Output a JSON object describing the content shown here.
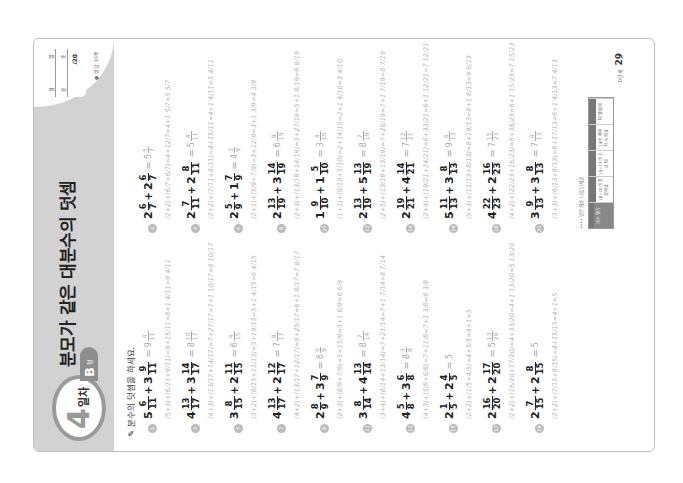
{
  "header": {
    "day_number": "4",
    "day_label": "일차",
    "type_letter": "B",
    "type_suffix": "형",
    "title": "분모가 같은 대분수의 덧셈",
    "score_labels": [
      "월",
      "일",
      "분",
      "초"
    ],
    "score_total": "/20",
    "answer_note": "● 정답 10쪽"
  },
  "instruction": "분수의 덧셈을 하세요.",
  "problems_left": [
    {
      "no": "1",
      "a": {
        "w": "5",
        "n": "6",
        "d": "11"
      },
      "b": {
        "w": "3",
        "n": "9",
        "d": "11"
      },
      "ans": {
        "w": "9",
        "n": "4",
        "d": "11"
      },
      "work": "(5+3)+(6/11+9/11)=8+15/11=8+1 4/11=9 4/11"
    },
    {
      "no": "3",
      "a": {
        "w": "4",
        "n": "13",
        "d": "17"
      },
      "b": {
        "w": "3",
        "n": "14",
        "d": "17"
      },
      "ans": {
        "w": "8",
        "n": "10",
        "d": "17"
      },
      "work": "(4+3)+(13/17+14/17)=7+27/17=7+1 10/17=8 10/17"
    },
    {
      "no": "5",
      "a": {
        "w": "3",
        "n": "8",
        "d": "15"
      },
      "b": {
        "w": "2",
        "n": "11",
        "d": "15"
      },
      "ans": {
        "w": "6",
        "n": "4",
        "d": "15"
      },
      "work": "(3+2)+(8/15+11/15)=5+19/15=5+1 4/15=6 4/15"
    },
    {
      "no": "7",
      "a": {
        "w": "4",
        "n": "13",
        "d": "17"
      },
      "b": {
        "w": "2",
        "n": "12",
        "d": "17"
      },
      "ans": {
        "w": "7",
        "n": "8",
        "d": "17"
      },
      "work": "(4+2)+(13/17+12/17)=6+25/17=6+1 8/17=7 8/17"
    },
    {
      "no": "9",
      "a": {
        "w": "2",
        "n": "8",
        "d": "9"
      },
      "b": {
        "w": "3",
        "n": "7",
        "d": "9"
      },
      "ans": {
        "w": "6",
        "n": "6",
        "d": "9"
      },
      "work": "(2+3)+(8/9+7/9)=5+15/9=5+1 6/9=6 6/9"
    },
    {
      "no": "11",
      "a": {
        "w": "3",
        "n": "8",
        "d": "14"
      },
      "b": {
        "w": "4",
        "n": "13",
        "d": "14"
      },
      "ans": {
        "w": "8",
        "n": "7",
        "d": "14"
      },
      "work": "(3+4)+(8/14+13/14)=7+21/14=7+1 7/14=8 7/14"
    },
    {
      "no": "13",
      "a": {
        "w": "4",
        "n": "5",
        "d": "8"
      },
      "b": {
        "w": "3",
        "n": "6",
        "d": "8"
      },
      "ans": {
        "w": "8",
        "n": "3",
        "d": "8"
      },
      "work": "(4+3)+(5/8+6/8)=7+11/8=7+1 3/8=8 3/8"
    },
    {
      "no": "15",
      "a": {
        "w": "2",
        "n": "1",
        "d": "5"
      },
      "b": {
        "w": "2",
        "n": "4",
        "d": "5"
      },
      "ans": {
        "w": "5",
        "n": "",
        "d": ""
      },
      "work": "(2+2)+(1/5+4/5)=4+5/5=4+1=5"
    },
    {
      "no": "17",
      "a": {
        "w": "2",
        "n": "16",
        "d": "20"
      },
      "b": {
        "w": "2",
        "n": "17",
        "d": "20"
      },
      "ans": {
        "w": "5",
        "n": "13",
        "d": "20"
      },
      "work": "(2+2)+(16/20+17/20)=4+33/20=4+1 13/20=5 13/20"
    },
    {
      "no": "19",
      "a": {
        "w": "2",
        "n": "7",
        "d": "15"
      },
      "b": {
        "w": "2",
        "n": "8",
        "d": "15"
      },
      "ans": {
        "w": "5",
        "n": "",
        "d": ""
      },
      "work": "(2+2)+(7/15+8/15)=4+15/15=4+1=5"
    }
  ],
  "problems_right": [
    {
      "no": "2",
      "a": {
        "w": "2",
        "n": "6",
        "d": "7"
      },
      "b": {
        "w": "2",
        "n": "6",
        "d": "7"
      },
      "ans": {
        "w": "5",
        "n": "5",
        "d": "7"
      },
      "work": "(2+2)+(6/7+6/7)=4+12/7=4+1 5/7=5 5/7"
    },
    {
      "no": "4",
      "a": {
        "w": "2",
        "n": "7",
        "d": "11"
      },
      "b": {
        "w": "2",
        "n": "8",
        "d": "11"
      },
      "ans": {
        "w": "5",
        "n": "4",
        "d": "11"
      },
      "work": "(2+2)+(7/11+8/11)=4+15/11=4+1 4/11=5 4/11"
    },
    {
      "no": "6",
      "a": {
        "w": "2",
        "n": "5",
        "d": "9"
      },
      "b": {
        "w": "1",
        "n": "7",
        "d": "9"
      },
      "ans": {
        "w": "4",
        "n": "3",
        "d": "9"
      },
      "work": "(2+1)+(5/9+7/9)=3+12/9=3+1 3/9=4 3/9"
    },
    {
      "no": "8",
      "a": {
        "w": "2",
        "n": "13",
        "d": "19"
      },
      "b": {
        "w": "3",
        "n": "14",
        "d": "19"
      },
      "ans": {
        "w": "6",
        "n": "8",
        "d": "19"
      },
      "work": "(2+3)+(13/19+14/19)=5+27/19=5+1 8/19=6 8/19"
    },
    {
      "no": "10",
      "a": {
        "w": "1",
        "n": "9",
        "d": "10"
      },
      "b": {
        "w": "1",
        "n": "5",
        "d": "10"
      },
      "ans": {
        "w": "3",
        "n": "4",
        "d": "10"
      },
      "work": "(1+1)+(9/10+5/10)=2+14/10=2+1 4/10=3 4/10"
    },
    {
      "no": "12",
      "a": {
        "w": "2",
        "n": "13",
        "d": "19"
      },
      "b": {
        "w": "5",
        "n": "13",
        "d": "19"
      },
      "ans": {
        "w": "8",
        "n": "7",
        "d": "19"
      },
      "work": "(2+5)+(13/19+13/19)=7+26/19=7+1 7/19=8 7/19"
    },
    {
      "no": "14",
      "a": {
        "w": "2",
        "n": "19",
        "d": "21"
      },
      "b": {
        "w": "4",
        "n": "14",
        "d": "21"
      },
      "ans": {
        "w": "7",
        "n": "12",
        "d": "21"
      },
      "work": "(2+4)+(19/21+14/21)=6+33/21=6+1 12/21=7 12/21"
    },
    {
      "no": "16",
      "a": {
        "w": "5",
        "n": "11",
        "d": "13"
      },
      "b": {
        "w": "3",
        "n": "8",
        "d": "13"
      },
      "ans": {
        "w": "9",
        "n": "6",
        "d": "13"
      },
      "work": "(5+3)+(11/13+8/13)=8+19/13=8+1 6/13=9 6/13"
    },
    {
      "no": "18",
      "a": {
        "w": "4",
        "n": "22",
        "d": "23"
      },
      "b": {
        "w": "2",
        "n": "16",
        "d": "23"
      },
      "ans": {
        "w": "7",
        "n": "15",
        "d": "23"
      },
      "work": "(4+2)+(22/23+16/23)=6+38/23=6+1 15/23=7 15/23"
    },
    {
      "no": "20",
      "a": {
        "w": "3",
        "n": "9",
        "d": "13"
      },
      "b": {
        "w": "3",
        "n": "8",
        "d": "13"
      },
      "ans": {
        "w": "7",
        "n": "4",
        "d": "13"
      },
      "work": "(3+3)+(9/13+8/13)=6+17/13=6+1 4/13=7 4/13"
    }
  ],
  "footer": {
    "note": "•••• 맞은 개수 다음 단계로",
    "table_cells": [
      "개수 평가",
      "18~20개 잘했어요",
      "15~17개 조금 더",
      "14개 이하 다시 해요",
      "더 열심히"
    ],
    "page_label": "D단계",
    "page_number": "29"
  },
  "colors": {
    "header_band": "#d2d2d2",
    "badge_ring": "#9a9a9a",
    "handwriting": "#b5b5b5",
    "text": "#222222"
  }
}
